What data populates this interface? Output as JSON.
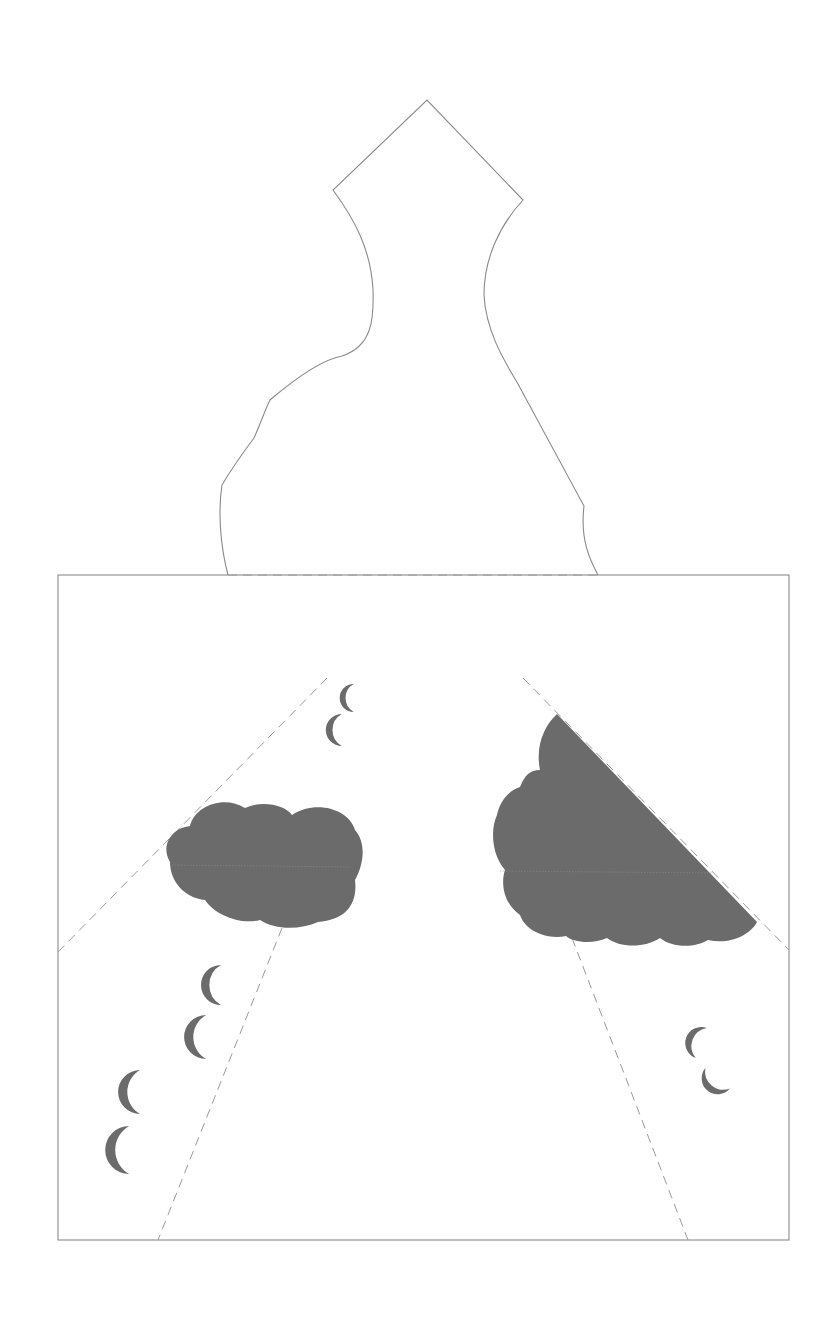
{
  "template": {
    "title": "",
    "colors": {
      "background": "#ffffff",
      "outline": "#8a8a8a",
      "fold_line": "#9a9a9a",
      "fill": "#6b6b6b",
      "seam": "#8c8c8c"
    },
    "dimensions": {
      "width": 835,
      "height": 1331
    }
  },
  "shapes": {
    "vase_outline": {
      "label": "vase-shaped top panel",
      "path": "M 228 575 C 220 545 218 510 222 485 C 232 468 245 450 254 438 C 262 420 265 410 270 400 C 290 383 320 360 342 356 C 372 346 374 320 373 290 C 371 250 355 220 333 190 L 427 100 L 523 200 C 500 225 484 258 484 295 C 486 332 505 362 518 384 L 584 506 C 580 540 590 560 598 575"
    },
    "square_panel": {
      "label": "square base panel",
      "x": 58,
      "y": 575,
      "width": 731,
      "height": 665
    },
    "fold_lines": [
      {
        "name": "top-edge-fold",
        "x1": 228,
        "y1": 575,
        "x2": 598,
        "y2": 575
      },
      {
        "name": "left-diagonal-fold",
        "x1": 58,
        "y1": 952,
        "x2": 330,
        "y2": 675
      },
      {
        "name": "right-diagonal-fold",
        "x1": 523,
        "y1": 678,
        "x2": 789,
        "y2": 950
      },
      {
        "name": "left-lower-fold",
        "x1": 282,
        "y1": 928,
        "x2": 158,
        "y2": 1240
      },
      {
        "name": "right-lower-fold",
        "x1": 572,
        "y1": 938,
        "x2": 688,
        "y2": 1240
      }
    ],
    "clouds": [
      {
        "name": "left-cloud",
        "path": "M 170 862 C 160 845 172 828 190 826 C 195 805 225 795 245 808 C 262 800 285 805 292 815 C 315 800 348 808 355 830 C 368 845 362 868 355 880 C 358 905 345 920 318 922 C 300 930 275 930 260 920 C 240 925 215 915 205 900 C 185 898 170 882 170 862 Z",
        "seam": {
          "x1": 172,
          "y1": 865,
          "x2": 350,
          "y2": 867
        }
      },
      {
        "name": "right-cloud",
        "path": "M 557 714 L 757 922 C 750 935 730 945 708 940 C 695 948 672 948 660 938 C 645 948 620 948 607 938 C 592 945 572 942 566 936 C 545 940 525 930 520 915 C 505 905 500 885 505 870 C 492 855 490 830 497 815 C 500 800 510 790 520 787 C 525 775 530 770 540 770 C 535 745 545 725 557 714 Z",
        "seam": {
          "x1": 500,
          "y1": 871,
          "x2": 713,
          "y2": 873
        }
      }
    ],
    "rain_drops": [
      {
        "name": "raindrop-1",
        "cx": 346,
        "cy": 698,
        "r": 14,
        "rot": 0
      },
      {
        "name": "raindrop-2",
        "cx": 333,
        "cy": 730,
        "r": 16,
        "rot": 0
      },
      {
        "name": "raindrop-3",
        "cx": 210,
        "cy": 985,
        "r": 20,
        "rot": 0
      },
      {
        "name": "raindrop-4",
        "cx": 194,
        "cy": 1037,
        "r": 22,
        "rot": 0
      },
      {
        "name": "raindrop-5",
        "cx": 128,
        "cy": 1092,
        "r": 22,
        "rot": 0
      },
      {
        "name": "raindrop-6",
        "cx": 116,
        "cy": 1150,
        "r": 24,
        "rot": 0
      },
      {
        "name": "raindrop-7",
        "cx": 693,
        "cy": 1040,
        "r": 16,
        "rot": 20
      },
      {
        "name": "raindrop-8",
        "cx": 712,
        "cy": 1085,
        "r": 16,
        "rot": -50
      }
    ]
  }
}
